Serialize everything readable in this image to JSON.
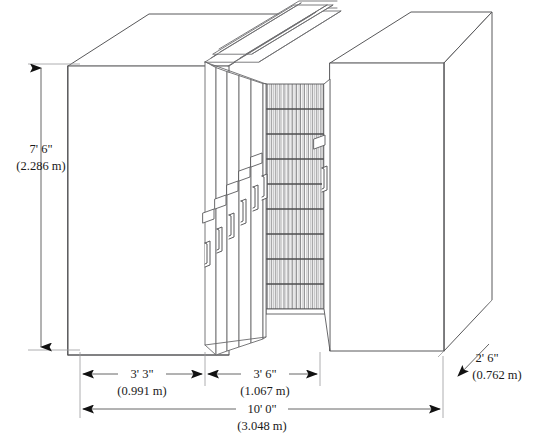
{
  "drawing": {
    "title": "Mobile Shelving System Isometric Dimension Drawing",
    "type": "technical-line-drawing",
    "line_color": "#58585a",
    "dim_color": "#1a1a1a",
    "fill_color": "#ffffff"
  },
  "dimensions": {
    "height": {
      "name": "overall-height",
      "imperial": "7' 6\"",
      "metric": "(2.286 m)",
      "orientation": "vertical",
      "side": "left"
    },
    "width_left_bay": {
      "name": "left-bay-width",
      "imperial": "3' 3\"",
      "metric": "(0.991 m)",
      "orientation": "horizontal"
    },
    "width_right_bay": {
      "name": "right-bay-width",
      "imperial": "3' 6\"",
      "metric": "(1.067 m)",
      "orientation": "horizontal"
    },
    "width_overall": {
      "name": "overall-width",
      "imperial": "10' 0\"",
      "metric": "(3.048 m)",
      "orientation": "horizontal"
    },
    "depth": {
      "name": "overall-depth",
      "imperial": "2' 6\"",
      "metric": "(0.762 m)",
      "orientation": "diagonal",
      "side": "right"
    }
  },
  "components": {
    "left_cabinet": "left-cabinet-block",
    "right_cabinet": "right-cabinet-block",
    "sliding_panels": "sliding-panel-faces",
    "open_aisle": "open-aisle-shelving",
    "handles": "panel-pull-handles",
    "label_holders": "panel-label-holders",
    "top_rails": "top-rails",
    "shelf_rows": 9,
    "panel_count": 6,
    "handle_count": 7,
    "label_holder_count": 6
  }
}
